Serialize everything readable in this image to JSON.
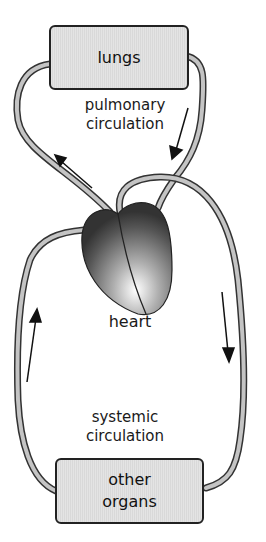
{
  "diagram": {
    "type": "circulation",
    "nodes": {
      "lungs": {
        "label": "lungs"
      },
      "heart": {
        "label": "heart"
      },
      "organs": {
        "label_line1": "other",
        "label_line2": "organs"
      }
    },
    "circuits": {
      "pulmonary": {
        "label_line1": "pulmonary",
        "label_line2": "circulation"
      },
      "systemic": {
        "label_line1": "systemic",
        "label_line2": "circulation"
      }
    },
    "flow": [
      {
        "from": "heart",
        "to": "lungs",
        "circuit": "pulmonary"
      },
      {
        "from": "lungs",
        "to": "heart",
        "circuit": "pulmonary"
      },
      {
        "from": "heart",
        "to": "other organs",
        "circuit": "systemic"
      },
      {
        "from": "other organs",
        "to": "heart",
        "circuit": "systemic"
      }
    ],
    "colors": {
      "vessel_outline": "#333333",
      "vessel_fill": "#bdbdbd",
      "box_fill": "#dedede",
      "heart_dark": "#3a3a3a",
      "heart_light": "#f2f2f2"
    }
  }
}
